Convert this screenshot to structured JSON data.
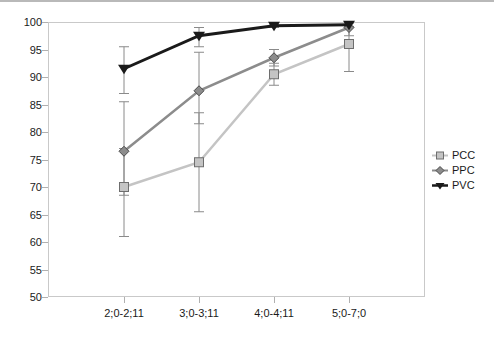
{
  "chart_data": {
    "type": "line",
    "title": "",
    "subtitle": "",
    "xlabel": "",
    "ylabel": "",
    "categories": [
      "2;0-2;11",
      "3;0-3;11",
      "4;0-4;11",
      "5;0-7;0"
    ],
    "ylim": [
      50,
      100
    ],
    "yticks": [
      50,
      55,
      60,
      65,
      70,
      75,
      80,
      85,
      90,
      95,
      100
    ],
    "ytick_labels": [
      "50",
      "55",
      "60",
      "65",
      "70",
      "75",
      "80",
      "85",
      "90",
      "95",
      "100"
    ],
    "grid": false,
    "legend_position": "right",
    "error_bars": "visible",
    "series": [
      {
        "name": "PCC",
        "color": "#c4c4c4",
        "marker": "square",
        "values": [
          70.0,
          74.5,
          90.5,
          96.0
        ],
        "err_low": [
          61.0,
          65.5,
          88.5,
          91.0
        ],
        "err_high": [
          77.0,
          83.5,
          92.5,
          99.0
        ]
      },
      {
        "name": "PPC",
        "color": "#8c8c8c",
        "marker": "diamond",
        "values": [
          76.5,
          87.5,
          93.5,
          99.0
        ],
        "err_low": [
          68.5,
          81.5,
          92.0,
          97.5
        ],
        "err_high": [
          85.5,
          94.5,
          95.0,
          100.0
        ]
      },
      {
        "name": "PVC",
        "color": "#1a1a1a",
        "marker": "triangle-down",
        "values": [
          91.5,
          97.5,
          99.3,
          99.5
        ],
        "err_low": [
          87.0,
          95.5,
          99.0,
          99.2
        ],
        "err_high": [
          95.5,
          99.0,
          99.6,
          99.8
        ]
      }
    ]
  },
  "legend": {
    "items": [
      {
        "label": "PCC"
      },
      {
        "label": "PPC"
      },
      {
        "label": "PVC"
      }
    ]
  }
}
